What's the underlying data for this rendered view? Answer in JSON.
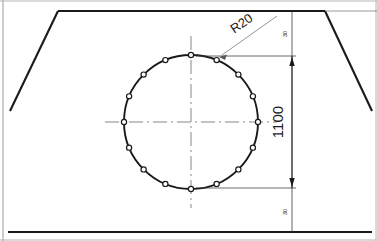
{
  "drawing": {
    "title": "Bolt circle detail on chamfered plate",
    "canvas": {
      "width": 377,
      "height": 241,
      "background": "#ffffff"
    },
    "colors": {
      "outline": "#1a1a1a",
      "thin_line": "#3a3a3a",
      "center_line": "#6b6b6b",
      "frame": "#9a9a9a",
      "text": "#1a1a1a"
    },
    "annotations": {
      "radius_label": "R20",
      "vertical_dimension": "1100",
      "top_offset": "30",
      "bottom_offset": "30"
    },
    "bolt_circle": {
      "center": {
        "x": 191,
        "y": 122
      },
      "radius": 67,
      "hole_count": 16,
      "hole_radius": 2.6,
      "angle_step_deg": 22.5,
      "start_angle_deg": -90
    },
    "plate": {
      "top_y": 11,
      "bottom_y": 232,
      "top_left_x": 58,
      "top_right_x": 325,
      "left_foot_x": 10,
      "right_foot_x": 372,
      "chamfer_bottom_y": 111
    },
    "dimension_line": {
      "x": 292,
      "top_y": 56,
      "bottom_y": 188,
      "top_tick_y": 11,
      "bottom_tick_y": 232
    },
    "leader": {
      "from": {
        "x": 277,
        "y": 16
      },
      "to": {
        "x": 219,
        "y": 57
      },
      "label_x": 244,
      "label_y": 26,
      "label_rotation_deg": -35
    }
  }
}
